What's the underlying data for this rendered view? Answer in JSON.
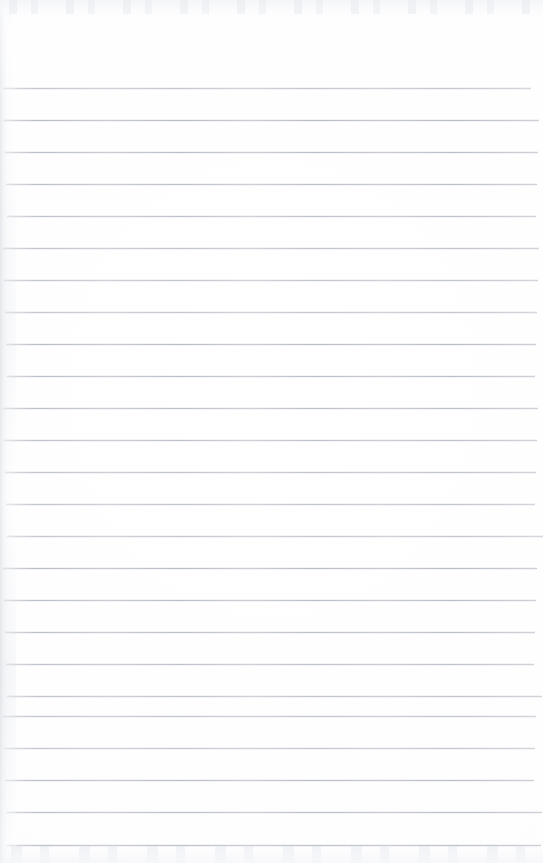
{
  "document": {
    "kind": "scanned-ruled-notebook-page",
    "page_width": 543,
    "page_height": 863,
    "background_color": "#ffffff",
    "has_handwriting": false,
    "has_printed_text": false,
    "visible_text": "",
    "header_margin_px": 88,
    "margin_rule": {
      "present": false
    },
    "ruling": {
      "line_color": "#b9bdc5",
      "line_thickness_px": 1,
      "line_spacing_px": 32,
      "first_line_y": 88,
      "line_start_x": 5,
      "line_end_x": 537,
      "line_count": 24,
      "line_y_positions": [
        88,
        120,
        152,
        184,
        216,
        248,
        280,
        312,
        344,
        376,
        408,
        440,
        472,
        504,
        536,
        568,
        600,
        632,
        664,
        696,
        716,
        748,
        780,
        812,
        845
      ]
    },
    "scan_artifacts": {
      "left_edge_shadow": true,
      "top_noise_band": true,
      "bottom_noise_band": true,
      "paper_tint": "#fefeff"
    }
  }
}
